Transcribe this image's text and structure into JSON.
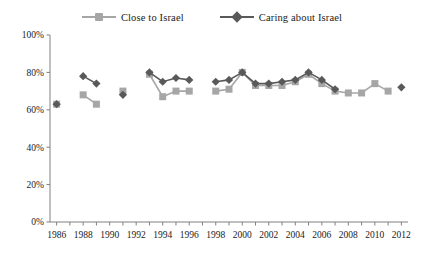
{
  "chart_data": {
    "type": "line",
    "title": "",
    "subtitle": "",
    "xlabel": "",
    "ylabel": "",
    "xlim": [
      1985.5,
      2012.5
    ],
    "ylim": [
      0,
      100
    ],
    "grid": false,
    "legend_position": "top-center",
    "y_ticks": [
      "0%",
      "20%",
      "40%",
      "60%",
      "80%",
      "100%"
    ],
    "y_tick_values": [
      0,
      20,
      40,
      60,
      80,
      100
    ],
    "x_ticks": [
      "1986",
      "1988",
      "1990",
      "1992",
      "1994",
      "1996",
      "1998",
      "2000",
      "2002",
      "2004",
      "2006",
      "2008",
      "2010",
      "2012"
    ],
    "x_tick_values": [
      1986,
      1988,
      1990,
      1992,
      1994,
      1996,
      1998,
      2000,
      2002,
      2004,
      2006,
      2008,
      2010,
      2012
    ],
    "x_minor_ticks": [
      1986,
      1987,
      1988,
      1989,
      1990,
      1991,
      1992,
      1993,
      1994,
      1995,
      1996,
      1997,
      1998,
      1999,
      2000,
      2001,
      2002,
      2003,
      2004,
      2005,
      2006,
      2007,
      2008,
      2009,
      2010,
      2011,
      2012
    ],
    "series": [
      {
        "name": "Close to Israel",
        "color": "#a6a6a6",
        "marker": "square",
        "segments": [
          [
            {
              "x": 1986,
              "y": 63
            }
          ],
          [
            {
              "x": 1988,
              "y": 68
            },
            {
              "x": 1989,
              "y": 63
            }
          ],
          [
            {
              "x": 1991,
              "y": 70
            }
          ],
          [
            {
              "x": 1993,
              "y": 79
            },
            {
              "x": 1994,
              "y": 67
            },
            {
              "x": 1995,
              "y": 70
            },
            {
              "x": 1996,
              "y": 70
            }
          ],
          [
            {
              "x": 1998,
              "y": 70
            },
            {
              "x": 1999,
              "y": 71
            },
            {
              "x": 2000,
              "y": 80
            },
            {
              "x": 2001,
              "y": 73
            },
            {
              "x": 2002,
              "y": 73
            },
            {
              "x": 2003,
              "y": 73
            },
            {
              "x": 2004,
              "y": 75
            },
            {
              "x": 2005,
              "y": 79
            },
            {
              "x": 2006,
              "y": 74
            },
            {
              "x": 2007,
              "y": 70
            },
            {
              "x": 2008,
              "y": 69
            },
            {
              "x": 2009,
              "y": 69
            },
            {
              "x": 2010,
              "y": 74
            },
            {
              "x": 2011,
              "y": 70
            }
          ]
        ]
      },
      {
        "name": "Caring about Israel",
        "color": "#595959",
        "marker": "diamond",
        "segments": [
          [
            {
              "x": 1986,
              "y": 63
            }
          ],
          [
            {
              "x": 1988,
              "y": 78
            },
            {
              "x": 1989,
              "y": 74
            }
          ],
          [
            {
              "x": 1991,
              "y": 68
            }
          ],
          [
            {
              "x": 1993,
              "y": 80
            },
            {
              "x": 1994,
              "y": 75
            },
            {
              "x": 1995,
              "y": 77
            },
            {
              "x": 1996,
              "y": 76
            }
          ],
          [
            {
              "x": 1998,
              "y": 75
            },
            {
              "x": 1999,
              "y": 76
            },
            {
              "x": 2000,
              "y": 80
            },
            {
              "x": 2001,
              "y": 74
            },
            {
              "x": 2002,
              "y": 74
            },
            {
              "x": 2003,
              "y": 75
            },
            {
              "x": 2004,
              "y": 76
            },
            {
              "x": 2005,
              "y": 80
            },
            {
              "x": 2006,
              "y": 76
            },
            {
              "x": 2007,
              "y": 71
            }
          ],
          [
            {
              "x": 2012,
              "y": 72
            }
          ]
        ]
      }
    ]
  },
  "legend": {
    "items": [
      {
        "label": "Close to Israel",
        "color": "#a6a6a6",
        "marker": "square"
      },
      {
        "label": "Caring about Israel",
        "color": "#595959",
        "marker": "diamond"
      }
    ]
  },
  "axis": {
    "line_color": "#808080"
  }
}
